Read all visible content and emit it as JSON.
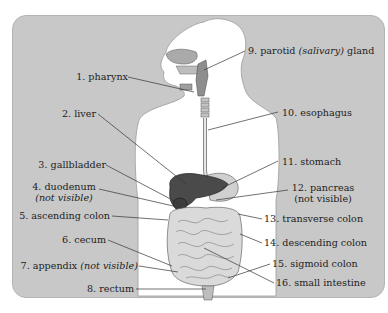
{
  "diagram": {
    "colors": {
      "panel_bg": "#c8c8c8",
      "body_fill": "#ffffff",
      "organ_dark": "#4a4a4a",
      "intestine": "#dcdcdc",
      "leader_line": "#333333"
    },
    "labels": [
      {
        "id": 1,
        "text": "1. pharynx"
      },
      {
        "id": 2,
        "text": "2. liver"
      },
      {
        "id": 3,
        "text": "3. gallbladder"
      },
      {
        "id": 4,
        "text": "4. duodenum",
        "note": "(not visible)"
      },
      {
        "id": 5,
        "text": "5. ascending colon"
      },
      {
        "id": 6,
        "text": "6. cecum"
      },
      {
        "id": 7,
        "text": "7. appendix",
        "note": "(not visible)"
      },
      {
        "id": 8,
        "text": "8. rectum"
      },
      {
        "id": 9,
        "text": "9. parotid",
        "note": "(salivary)",
        "suffix": "gland"
      },
      {
        "id": 10,
        "text": "10. esophagus"
      },
      {
        "id": 11,
        "text": "11. stomach"
      },
      {
        "id": 12,
        "text": "12. pancreas",
        "note": "(not visible)"
      },
      {
        "id": 13,
        "text": "13. transverse colon"
      },
      {
        "id": 14,
        "text": "14. descending colon"
      },
      {
        "id": 15,
        "text": "15. sigmoid colon"
      },
      {
        "id": 16,
        "text": "16. small intestine"
      }
    ]
  }
}
